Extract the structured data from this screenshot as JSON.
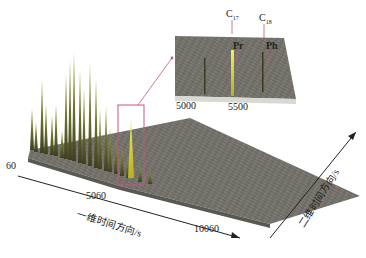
{
  "figure": {
    "type": "3D surface plot (GC×GC chromatogram)",
    "colors": {
      "surface": "#7d7b74",
      "surface_dark": "#5e5c56",
      "peak_green": "#7c8a2a",
      "peak_yellow": "#e6e33a",
      "highlight_box": "#c2587a",
      "arrow": "#c2587a",
      "axis": "#222222"
    },
    "x_axis": {
      "label": "一维时间方向/s",
      "ticks": [
        "60",
        "5060",
        "10060"
      ]
    },
    "y_axis": {
      "label": "二维时间方向/s"
    },
    "inset": {
      "ticks": [
        "5000",
        "5500"
      ],
      "annotations": [
        {
          "label": "C",
          "sub": "17"
        },
        {
          "label": "C",
          "sub": "18"
        },
        {
          "label": "Pr",
          "sub": ""
        },
        {
          "label": "Ph",
          "sub": ""
        }
      ]
    }
  }
}
